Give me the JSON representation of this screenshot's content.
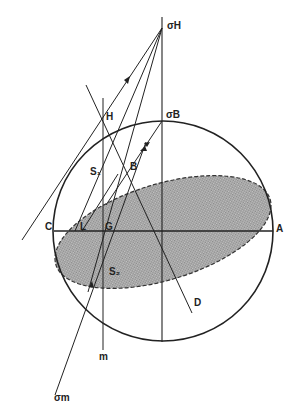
{
  "diagram": {
    "type": "Mohr-circle stress construction",
    "labels": {
      "sigma_H": "σH",
      "sigma_B": "σB",
      "H": "H",
      "B": "B",
      "S1": "S₁",
      "S2": "S₂",
      "C": "C",
      "L": "L",
      "G": "G",
      "A": "A",
      "D": "D",
      "m": "m",
      "sigma_m": "σm"
    },
    "colors": {
      "line": "#222222",
      "ellipse_fill": "#a8a8a8",
      "background": "#ffffff"
    }
  }
}
